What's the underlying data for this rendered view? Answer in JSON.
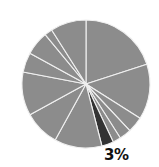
{
  "chart_data": {
    "type": "pie",
    "title": "",
    "start_angle_deg": 0,
    "direction": "clockwise",
    "slices": [
      {
        "value": 20,
        "color": "#8c8c8c"
      },
      {
        "value": 14,
        "color": "#8c8c8c"
      },
      {
        "value": 4,
        "color": "#8c8c8c"
      },
      {
        "value": 3,
        "color": "#8c8c8c"
      },
      {
        "value": 2,
        "color": "#8c8c8c"
      },
      {
        "value": 3,
        "color": "#333333",
        "label": "3%",
        "highlighted": true
      },
      {
        "value": 12,
        "color": "#8c8c8c"
      },
      {
        "value": 9,
        "color": "#8c8c8c"
      },
      {
        "value": 11,
        "color": "#8c8c8c"
      },
      {
        "value": 5,
        "color": "#8c8c8c"
      },
      {
        "value": 6,
        "color": "#8c8c8c"
      },
      {
        "value": 2,
        "color": "#8c8c8c"
      },
      {
        "value": 9,
        "color": "#8c8c8c"
      }
    ],
    "annotations": [
      "3%"
    ],
    "legend": null,
    "separator_color": "#f0f0f0"
  },
  "label": {
    "text": "3%"
  }
}
